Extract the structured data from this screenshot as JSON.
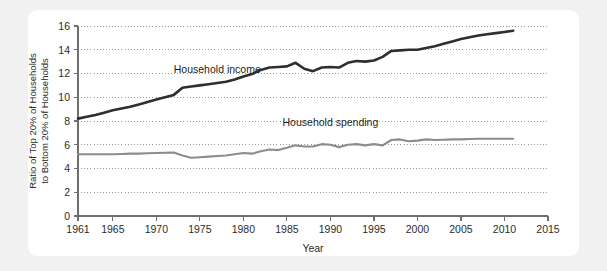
{
  "theme": {
    "page_background": "#f1f1f1",
    "card_background": "#ffffff",
    "axis_color": "#6e6e6e",
    "grid_color": "#9a9a9a",
    "text_color": "#2b2b2b"
  },
  "chart_data": {
    "type": "line",
    "title": "",
    "subtitle": "",
    "xlabel": "Year",
    "ylabel_line1": "Ratio of Top 20% of Households",
    "ylabel_line2": "to Bottom 20% of Households",
    "xlim": [
      1961,
      2015
    ],
    "ylim": [
      0,
      16
    ],
    "xticks": [
      1961,
      1965,
      1970,
      1975,
      1980,
      1985,
      1990,
      1995,
      2000,
      2005,
      2010,
      2015
    ],
    "xtick_labels": [
      "1961",
      "1965",
      "1970",
      "1975",
      "1980",
      "1985",
      "1990",
      "1995",
      "2000",
      "2005",
      "2010",
      "2015"
    ],
    "yticks": [
      0,
      2,
      4,
      6,
      8,
      10,
      12,
      14,
      16
    ],
    "ytick_labels": [
      "0",
      "2",
      "4",
      "6",
      "8",
      "10",
      "12",
      "14",
      "16"
    ],
    "grid": "horizontal-dotted",
    "legend_position": "inline-annotations",
    "annotations": [
      {
        "text": "Household income",
        "x": 1977.0,
        "y": 12.05,
        "series": "income"
      },
      {
        "text": "Household spending",
        "x": 1990.0,
        "y": 7.55,
        "series": "spending"
      }
    ],
    "series": [
      {
        "name": "Household income",
        "color": "#2e2e2e",
        "width": 2.6,
        "x": [
          1961,
          1962,
          1963,
          1964,
          1965,
          1966,
          1967,
          1968,
          1969,
          1970,
          1971,
          1972,
          1973,
          1974,
          1975,
          1976,
          1977,
          1978,
          1979,
          1980,
          1981,
          1982,
          1983,
          1984,
          1985,
          1986,
          1987,
          1988,
          1989,
          1990,
          1991,
          1992,
          1993,
          1994,
          1995,
          1996,
          1997,
          1998,
          1999,
          2000,
          2001,
          2002,
          2003,
          2004,
          2005,
          2006,
          2007,
          2008,
          2009,
          2010,
          2011
        ],
        "values": [
          8.2,
          8.35,
          8.5,
          8.7,
          8.9,
          9.05,
          9.2,
          9.4,
          9.6,
          9.8,
          10.0,
          10.2,
          10.8,
          10.9,
          11.0,
          11.1,
          11.2,
          11.3,
          11.5,
          11.75,
          11.95,
          12.3,
          12.5,
          12.55,
          12.6,
          12.9,
          12.4,
          12.2,
          12.5,
          12.55,
          12.5,
          12.9,
          13.05,
          13.0,
          13.1,
          13.4,
          13.9,
          13.95,
          14.0,
          14.0,
          14.15,
          14.3,
          14.5,
          14.7,
          14.9,
          15.05,
          15.2,
          15.3,
          15.4,
          15.5,
          15.6
        ]
      },
      {
        "name": "Household spending",
        "color": "#8c8c8c",
        "width": 2.1,
        "x": [
          1961,
          1962,
          1963,
          1964,
          1965,
          1966,
          1967,
          1968,
          1969,
          1970,
          1971,
          1972,
          1973,
          1974,
          1975,
          1976,
          1977,
          1978,
          1979,
          1980,
          1981,
          1982,
          1983,
          1984,
          1985,
          1986,
          1987,
          1988,
          1989,
          1990,
          1991,
          1992,
          1993,
          1994,
          1995,
          1996,
          1997,
          1998,
          1999,
          2000,
          2001,
          2002,
          2003,
          2004,
          2005,
          2006,
          2007,
          2008,
          2009,
          2010,
          2011
        ],
        "values": [
          5.2,
          5.2,
          5.2,
          5.2,
          5.2,
          5.22,
          5.25,
          5.25,
          5.28,
          5.3,
          5.32,
          5.35,
          5.1,
          4.9,
          4.95,
          5.0,
          5.05,
          5.1,
          5.2,
          5.3,
          5.25,
          5.45,
          5.6,
          5.55,
          5.75,
          5.95,
          5.85,
          5.85,
          6.05,
          6.0,
          5.8,
          6.0,
          6.05,
          5.95,
          6.05,
          5.95,
          6.4,
          6.45,
          6.3,
          6.35,
          6.45,
          6.4,
          6.42,
          6.45,
          6.45,
          6.48,
          6.5,
          6.5,
          6.5,
          6.5,
          6.5
        ]
      }
    ]
  }
}
